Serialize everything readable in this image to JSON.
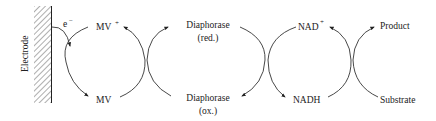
{
  "diagram": {
    "electrode": {
      "label": "Electrode"
    },
    "electron": {
      "label": "e",
      "charge": "−"
    },
    "species": {
      "mv_ox": {
        "label": "MV",
        "charge": "+"
      },
      "mv_red": {
        "label": "MV"
      },
      "diaphorase_red": {
        "line1": "Diaphorase",
        "line2": "(red.)"
      },
      "diaphorase_ox": {
        "line1": "Diaphorase",
        "line2": "(ox.)"
      },
      "nad_plus": {
        "label": "NAD",
        "charge": "+"
      },
      "nadh": {
        "label": "NADH"
      },
      "product": {
        "label": "Product"
      },
      "substrate": {
        "label": "Substrate"
      }
    },
    "colors": {
      "ink": "#222222",
      "background": "#ffffff"
    }
  }
}
